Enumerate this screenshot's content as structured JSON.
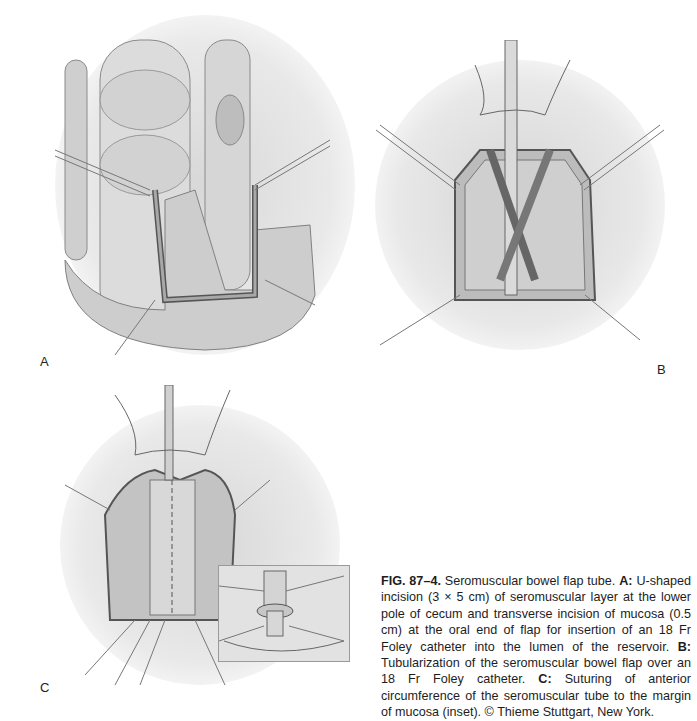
{
  "figure": {
    "number": "FIG. 87–4.",
    "title": "Seromuscular bowel flap tube.",
    "panels": [
      {
        "label": "A",
        "description": "U-shaped incision (3 × 5 cm) of seromuscular layer at the lower pole of cecum and transverse incision of mucosa (0.5 cm) at the oral end of flap for insertion of an 18 Fr Foley catheter into the lumen of the reservoir."
      },
      {
        "label": "B",
        "description": "Tubularization of the seromuscular bowel flap over an 18 Fr Foley catheter."
      },
      {
        "label": "C",
        "description": "Suturing of anterior circumference of the seromuscular tube to the margin of mucosa (inset)."
      }
    ],
    "caption_parts": {
      "fig": "FIG. 87–4.",
      "title": " Seromuscular bowel flap tube. ",
      "a_label": "A:",
      "a_text": " U-shaped incision (3 × 5 cm) of seromuscular layer at the lower pole of cecum and transverse incision of mucosa (0.5 cm) at the oral end of flap for insertion of an 18 Fr Foley catheter into the lumen of the reservoir. ",
      "b_label": "B:",
      "b_text": " Tubularization of the seromuscular bowel flap over an 18 Fr Foley catheter. ",
      "c_label": "C:",
      "c_text": " Suturing of anterior circumference of the seromuscular tube to the margin of mucosa (inset). ",
      "copyright": "© Thieme Stuttgart, New York."
    }
  },
  "labels": {
    "a": "A",
    "b": "B",
    "c": "C"
  }
}
